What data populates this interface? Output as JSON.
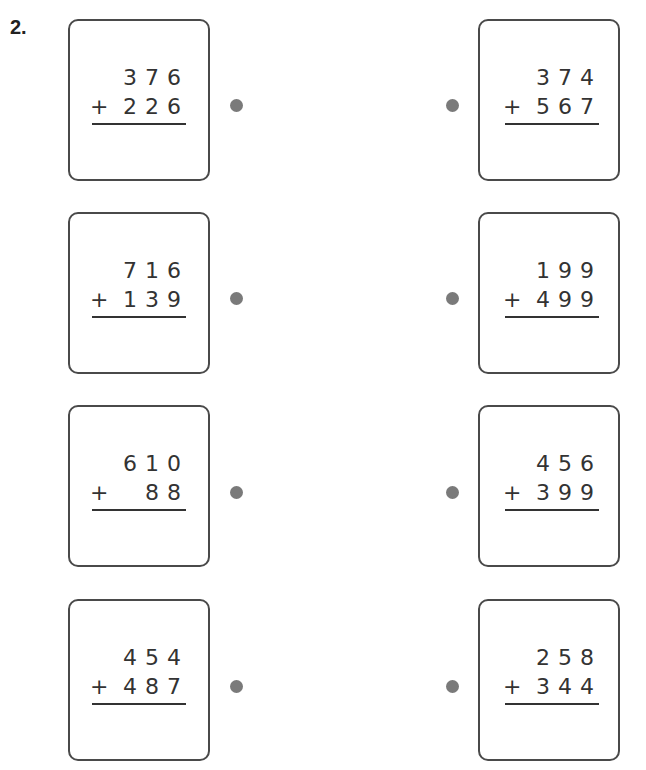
{
  "question_number": "2.",
  "left_problems": [
    {
      "top": [
        "3",
        "7",
        "6"
      ],
      "bottom": [
        "2",
        "2",
        "6"
      ],
      "operator": "+"
    },
    {
      "top": [
        "7",
        "1",
        "6"
      ],
      "bottom": [
        "1",
        "3",
        "9"
      ],
      "operator": "+"
    },
    {
      "top": [
        "6",
        "1",
        "0"
      ],
      "bottom": [
        "",
        "8",
        "8"
      ],
      "operator": "+"
    },
    {
      "top": [
        "4",
        "5",
        "4"
      ],
      "bottom": [
        "4",
        "8",
        "7"
      ],
      "operator": "+"
    }
  ],
  "right_problems": [
    {
      "top": [
        "3",
        "7",
        "4"
      ],
      "bottom": [
        "5",
        "6",
        "7"
      ],
      "operator": "+"
    },
    {
      "top": [
        "1",
        "9",
        "9"
      ],
      "bottom": [
        "4",
        "9",
        "9"
      ],
      "operator": "+"
    },
    {
      "top": [
        "4",
        "5",
        "6"
      ],
      "bottom": [
        "3",
        "9",
        "9"
      ],
      "operator": "+"
    },
    {
      "top": [
        "2",
        "5",
        "8"
      ],
      "bottom": [
        "3",
        "4",
        "4"
      ],
      "operator": "+"
    }
  ]
}
